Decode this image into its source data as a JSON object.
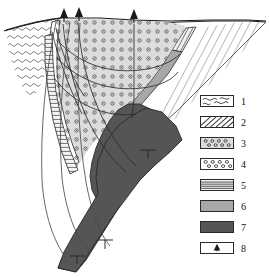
{
  "figure": {
    "type": "geologic-cross-section"
  },
  "colors": {
    "outline": "#2a2a2a",
    "background": "#ffffff",
    "unit1_fill": "#ffffff",
    "unit2_fill": "#ffffff",
    "unit3_fill": "#e2e2e2",
    "unit4_fill": "#ffffff",
    "unit5_fill": "#f2f2f2",
    "unit6_fill": "#a8a8a8",
    "unit7_fill": "#555555",
    "unit8_fill": "#ffffff"
  },
  "legend": {
    "items": [
      {
        "num": "1",
        "pattern": "wavy-lines",
        "icon": "wavy-lines-swatch"
      },
      {
        "num": "2",
        "pattern": "diagonal-hatch",
        "icon": "diagonal-hatch-swatch"
      },
      {
        "num": "3",
        "pattern": "circles-on-gray",
        "icon": "circles-gray-swatch"
      },
      {
        "num": "4",
        "pattern": "circles-on-white",
        "icon": "circles-white-swatch"
      },
      {
        "num": "5",
        "pattern": "horizontal-lines",
        "icon": "horizontal-lines-swatch"
      },
      {
        "num": "6",
        "pattern": "solid-light-gray",
        "icon": "light-gray-swatch"
      },
      {
        "num": "7",
        "pattern": "solid-dark-gray",
        "icon": "dark-gray-swatch"
      },
      {
        "num": "8",
        "pattern": "volcano-symbol",
        "icon": "volcano-icon"
      }
    ]
  },
  "section": {
    "vents": [
      {
        "name": "vent-left",
        "x": 64,
        "y": 22
      },
      {
        "name": "vent-middle",
        "x": 79,
        "y": 21
      },
      {
        "name": "vent-right",
        "x": 134,
        "y": 23
      }
    ],
    "annotations": {
      "dip_marks": [
        {
          "name": "dip-mark-upper",
          "x": 148,
          "y": 152
        },
        {
          "name": "dip-mark-lower",
          "x": 104,
          "y": 241
        },
        {
          "name": "dip-mark-base",
          "x": 77,
          "y": 257
        }
      ]
    }
  }
}
